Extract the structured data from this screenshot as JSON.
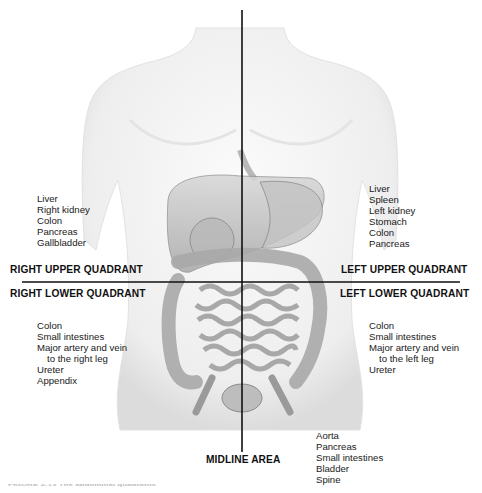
{
  "figure": {
    "type": "anatomical quadrant diagram",
    "subject": "abdominal quadrants",
    "colors": {
      "lines": "#111111",
      "background": "#ffffff",
      "text": "#1a1a1a",
      "body_shading": "#d9d9d9"
    }
  },
  "quadrants": {
    "right_upper": {
      "label": "RIGHT UPPER QUADRANT",
      "organs": [
        "Liver",
        "Right kidney",
        "Colon",
        "Pancreas",
        "Gallbladder"
      ]
    },
    "left_upper": {
      "label": "LEFT UPPER QUADRANT",
      "organs": [
        "Liver",
        "Spleen",
        "Left kidney",
        "Stomach",
        "Colon",
        "Pancreas"
      ]
    },
    "right_lower": {
      "label": "RIGHT LOWER QUADRANT",
      "organs": [
        "Colon",
        "Small intestines",
        "Major artery and vein",
        "to the right leg",
        "Ureter",
        "Appendix"
      ]
    },
    "left_lower": {
      "label": "LEFT LOWER QUADRANT",
      "organs": [
        "Colon",
        "Small intestines",
        "Major artery and vein",
        "to the left leg",
        "Ureter"
      ]
    },
    "midline": {
      "label": "MIDLINE AREA",
      "organs": [
        "Aorta",
        "Pancreas",
        "Small intestines",
        "Bladder",
        "Spine"
      ]
    }
  },
  "caption": "FIGURE 2-13 The abdominal quadrants"
}
